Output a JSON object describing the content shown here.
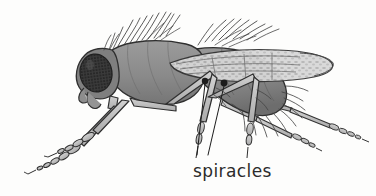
{
  "figure": {
    "title": "",
    "background_color": "#fdfdfc"
  },
  "annotations": [
    {
      "id": "spiracles",
      "label": "spiracles",
      "label_x": 193,
      "label_y": 175,
      "leader_lines": [
        {
          "from_x": 205,
          "from_y": 82,
          "to_x": 197,
          "to_y": 155
        },
        {
          "from_x": 224,
          "from_y": 84,
          "to_x": 208,
          "to_y": 155
        }
      ],
      "markers": [
        {
          "x": 205,
          "y": 81,
          "r": 3.2,
          "color": "#1c1c1c"
        },
        {
          "x": 224,
          "y": 83,
          "r": 3.4,
          "color": "#1c1c1c"
        }
      ]
    }
  ],
  "anatomy": {
    "parts": [
      {
        "name": "compound-eye",
        "color": "#3b3b3b"
      },
      {
        "name": "head",
        "color": "#7d7d7d"
      },
      {
        "name": "thorax",
        "color": "#8e8e8e"
      },
      {
        "name": "abdomen",
        "color": "#8a8a8a"
      },
      {
        "name": "wing",
        "color": "#c9c9c9"
      },
      {
        "name": "legs",
        "color": "#c2c2c2"
      },
      {
        "name": "bristles",
        "color": "#4a4a4a"
      },
      {
        "name": "outline",
        "color": "#2e2e2e"
      }
    ]
  },
  "colors": {
    "ink": "#2e2e2e",
    "eye_dark": "#3b3b3b",
    "body_mid": "#8e8e8e",
    "body_dark": "#6e6e6e",
    "body_light": "#a8a8a8",
    "wing": "#cfcfcf",
    "leg": "#c2c2c2",
    "marker": "#1c1c1c",
    "paper": "#fdfdfc"
  }
}
